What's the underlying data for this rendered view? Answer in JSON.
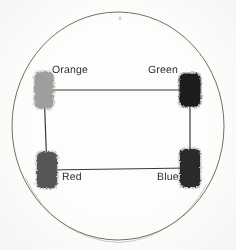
{
  "figure": {
    "type": "annotated-photo-diagram",
    "background_color": "#fdfdfc",
    "plate": {
      "name": "circular plate outline",
      "center_x": 118,
      "center_y": 126,
      "radius_x": 106,
      "radius_y": 114,
      "stroke_color": "#6f6f6a",
      "stroke_width": 1
    },
    "top_tick": {
      "name": "top tick mark",
      "x": 120,
      "y": 18,
      "color": "#8a8a85"
    },
    "connector_color": "#3a3a38",
    "connector_width": 1.2,
    "nodes": [
      {
        "id": "orange",
        "label": "Orange",
        "blob_color": "#9e9e9c",
        "blob_x": 44,
        "blob_y": 90,
        "blob_w": 19,
        "blob_h": 37,
        "label_x": 52,
        "label_y": 65
      },
      {
        "id": "green",
        "label": "Green",
        "blob_color": "#1f1f1e",
        "blob_x": 190,
        "blob_y": 90,
        "blob_w": 21,
        "blob_h": 33,
        "label_x": 148,
        "label_y": 65
      },
      {
        "id": "red",
        "label": "Red",
        "blob_color": "#575755",
        "blob_x": 47,
        "blob_y": 170,
        "blob_w": 20,
        "blob_h": 36,
        "label_x": 62,
        "label_y": 172
      },
      {
        "id": "blue",
        "label": "Blue",
        "blob_color": "#2b2b2a",
        "blob_x": 190,
        "blob_y": 168,
        "blob_w": 20,
        "blob_h": 38,
        "label_x": 157,
        "label_y": 172
      }
    ],
    "edges": [
      {
        "name": "orange-to-green",
        "from": "orange",
        "to": "green"
      },
      {
        "name": "green-to-blue",
        "from": "green",
        "to": "blue"
      },
      {
        "name": "blue-to-red",
        "from": "blue",
        "to": "red"
      },
      {
        "name": "red-to-orange",
        "from": "red",
        "to": "orange"
      }
    ]
  }
}
